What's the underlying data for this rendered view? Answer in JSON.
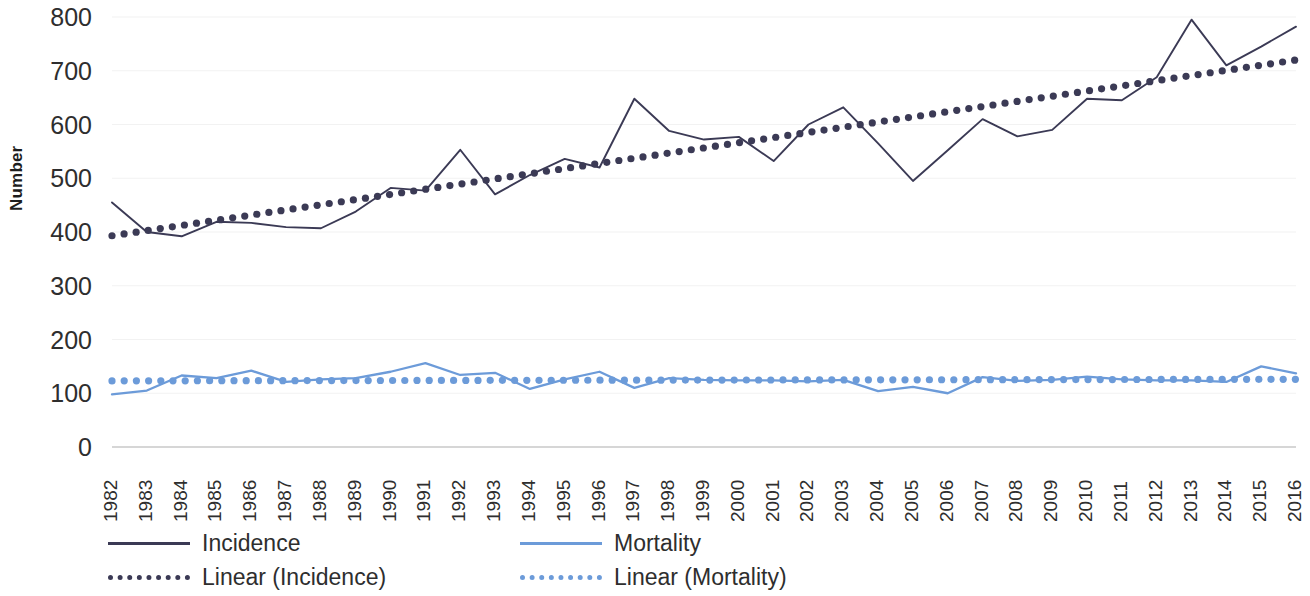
{
  "chart_data": {
    "type": "line",
    "title": "",
    "xlabel": "",
    "ylabel": "Number",
    "ylim": [
      0,
      800
    ],
    "ytick_step": 100,
    "yticks": [
      "800",
      "700",
      "600",
      "500",
      "400",
      "300",
      "200",
      "100",
      "0"
    ],
    "grid": true,
    "legend_position": "bottom-left",
    "categories": [
      "1982",
      "1983",
      "1984",
      "1985",
      "1986",
      "1987",
      "1988",
      "1989",
      "1990",
      "1991",
      "1992",
      "1993",
      "1994",
      "1995",
      "1996",
      "1997",
      "1998",
      "1999",
      "2000",
      "2001",
      "2002",
      "2003",
      "2004",
      "2005",
      "2006",
      "2007",
      "2008",
      "2009",
      "2010",
      "2011",
      "2012",
      "2013",
      "2014",
      "2015",
      "2016"
    ],
    "series": [
      {
        "name": "Incidence",
        "style": "solid",
        "color": "#3b3a55",
        "values": [
          455,
          400,
          392,
          419,
          417,
          409,
          407,
          438,
          482,
          477,
          553,
          470,
          506,
          536,
          520,
          648,
          588,
          572,
          577,
          532,
          600,
          632,
          565,
          495,
          552,
          610,
          578,
          590,
          648,
          645,
          688,
          795,
          710,
          745,
          782
        ]
      },
      {
        "name": "Mortality",
        "style": "solid",
        "color": "#6c9bd9",
        "values": [
          98,
          105,
          133,
          128,
          142,
          121,
          126,
          128,
          140,
          156,
          134,
          138,
          108,
          126,
          140,
          110,
          128,
          125,
          124,
          124,
          122,
          125,
          104,
          112,
          100,
          130,
          123,
          125,
          131,
          126,
          124,
          124,
          121,
          150,
          137
        ]
      },
      {
        "name": "Linear (Incidence)",
        "style": "dotted",
        "color": "#3b3a55",
        "trend_start": 393,
        "trend_end": 720
      },
      {
        "name": "Linear (Mortality)",
        "style": "dotted",
        "color": "#6c9bd9",
        "trend_start": 123,
        "trend_end": 126
      }
    ],
    "legend": [
      {
        "label": "Incidence",
        "style": "solid",
        "color": "#3b3a55"
      },
      {
        "label": "Linear (Incidence)",
        "style": "dotted",
        "color": "#3b3a55"
      },
      {
        "label": "Mortality",
        "style": "solid",
        "color": "#6c9bd9"
      },
      {
        "label": "Linear (Mortality)",
        "style": "dotted",
        "color": "#6c9bd9"
      }
    ]
  },
  "colors": {
    "incidence": "#3b3a55",
    "mortality": "#6c9bd9",
    "axis": "#c9c9c9",
    "grid": "#f2f2f2",
    "text": "#2e2e2e"
  }
}
